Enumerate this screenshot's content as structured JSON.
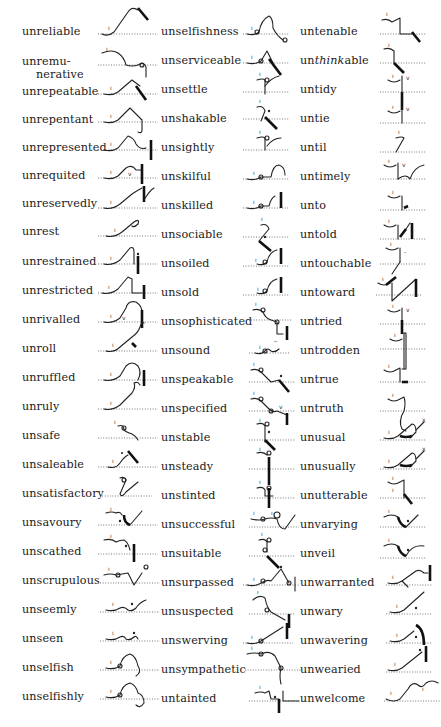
{
  "columns": [
    {
      "entries": [
        {
          "word": "unreliable"
        },
        {
          "word": "unremu-",
          "word2": "nerative"
        },
        {
          "word": "unrepeatable"
        },
        {
          "word": "unrepentant"
        },
        {
          "word": "unrepresented"
        },
        {
          "word": "unrequited"
        },
        {
          "word": "unreservedly"
        },
        {
          "word": "unrest"
        },
        {
          "word": "unrestrained"
        },
        {
          "word": "unrestricted"
        },
        {
          "word": "unrivalled"
        },
        {
          "word": "unroll"
        },
        {
          "word": "unruffled"
        },
        {
          "word": "unruly"
        },
        {
          "word": "unsafe"
        },
        {
          "word": "unsaleable"
        },
        {
          "word": "unsatisfactory"
        },
        {
          "word": "unsavoury"
        },
        {
          "word": "unscathed"
        },
        {
          "word": "unscrupulous"
        },
        {
          "word": "unseemly"
        },
        {
          "word": "unseen"
        },
        {
          "word": "unselfish"
        },
        {
          "word": "unselfishly"
        }
      ]
    },
    {
      "entries": [
        {
          "word": "unselfishness"
        },
        {
          "word": "unserviceable"
        },
        {
          "word": "unsettle"
        },
        {
          "word": "unshakable"
        },
        {
          "word": "unsightly"
        },
        {
          "word": "unskilful"
        },
        {
          "word": "unskilled"
        },
        {
          "word": "unsociable"
        },
        {
          "word": "unsoiled"
        },
        {
          "word": "unsold"
        },
        {
          "word": "unsophisticated"
        },
        {
          "word": "unsound"
        },
        {
          "word": "unspeakable"
        },
        {
          "word": "unspecified"
        },
        {
          "word": "unstable"
        },
        {
          "word": "unsteady"
        },
        {
          "word": "unstinted"
        },
        {
          "word": "unsuccessful"
        },
        {
          "word": "unsuitable"
        },
        {
          "word": "unsurpassed"
        },
        {
          "word": "unsuspected"
        },
        {
          "word": "unswerving"
        },
        {
          "word": "unsympathetic"
        },
        {
          "word": "untainted"
        }
      ]
    },
    {
      "entries": [
        {
          "word": "untenable"
        },
        {
          "word": "un",
          "italic": "think",
          "word_end": "able"
        },
        {
          "word": "untidy"
        },
        {
          "word": "untie"
        },
        {
          "word": "until"
        },
        {
          "word": "untimely"
        },
        {
          "word": "unto"
        },
        {
          "word": "untold"
        },
        {
          "word": "untouchable"
        },
        {
          "word": "untoward"
        },
        {
          "word": "untried"
        },
        {
          "word": "untrodden"
        },
        {
          "word": "untrue"
        },
        {
          "word": "untruth"
        },
        {
          "word": "unusual"
        },
        {
          "word": "unusually"
        },
        {
          "word": "unutterable"
        },
        {
          "word": "unvarying"
        },
        {
          "word": "unveil"
        },
        {
          "word": "unwarranted"
        },
        {
          "word": "unwary"
        },
        {
          "word": "unwavering"
        },
        {
          "word": "unwearied"
        },
        {
          "word": "unwelcome"
        }
      ]
    }
  ]
}
